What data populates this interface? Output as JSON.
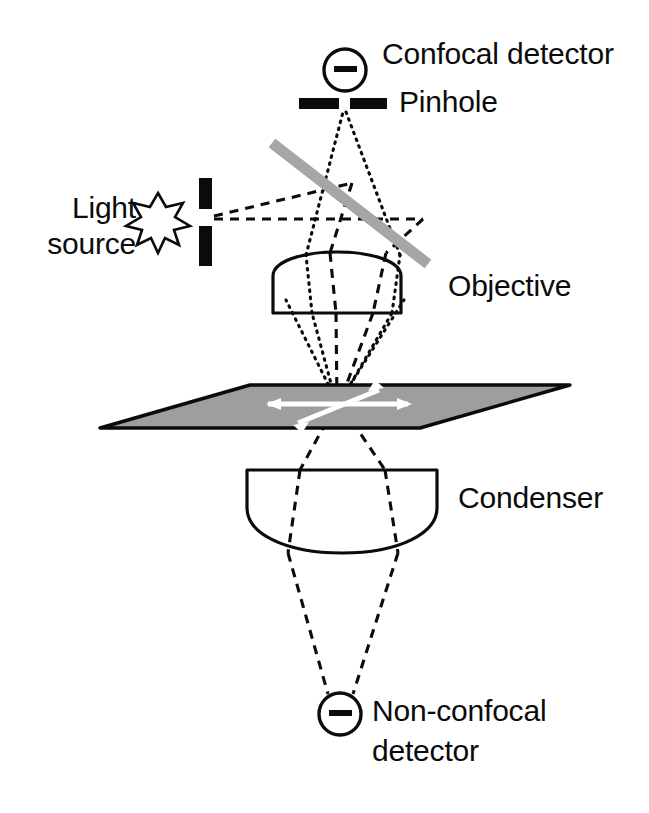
{
  "figure": {
    "background_color": "#ffffff",
    "ink_color": "#0b0b0b",
    "beamsplitter_color": "#a6a6a6",
    "specimen_fill_color": "#9e9e9e",
    "arrow_color": "#ffffff"
  },
  "labels": {
    "confocal_detector": "Confocal detector",
    "pinhole": "Pinhole",
    "light_source_line1": "Light",
    "light_source_line2": "source",
    "objective": "Objective",
    "condenser": "Condenser",
    "non_confocal_detector_line1": "Non-confocal",
    "non_confocal_detector_line2": "detector"
  },
  "components": {
    "confocal_detector": {
      "name": "confocal-detector",
      "shape": "circle-with-horizontal-bar",
      "center_x": 345,
      "center_y": 70,
      "radius": 21
    },
    "pinhole": {
      "name": "pinhole-aperture",
      "shape": "two-horizontal-bars-with-gap",
      "left_bar": {
        "x": 299,
        "y": 98,
        "width": 40,
        "height": 11
      },
      "right_bar": {
        "x": 350,
        "y": 98,
        "width": 37,
        "height": 11
      },
      "gap_center_x": 344
    },
    "light_source": {
      "name": "light-source-star",
      "shape": "eight-point-star-outline",
      "center_x": 158,
      "center_y": 218,
      "outer_radius": 25,
      "inner_radius": 11
    },
    "source_slit": {
      "name": "source-slit-aperture",
      "shape": "two-vertical-bars-with-gap",
      "top_bar": {
        "x": 199,
        "y": 178,
        "width": 13,
        "height": 31
      },
      "bottom_bar": {
        "x": 199,
        "y": 226,
        "width": 13,
        "height": 40
      },
      "gap_center_y": 217
    },
    "beamsplitter": {
      "name": "beamsplitter",
      "shape": "thick-diagonal-bar",
      "x1": 272,
      "y1": 143,
      "x2": 428,
      "y2": 264,
      "thickness": 10,
      "color": "#a6a6a6"
    },
    "objective": {
      "name": "objective-lens",
      "shape": "plano-convex-dome-up",
      "left_x": 273,
      "right_x": 401,
      "flat_bottom_y": 313,
      "dome_apex_y": 252,
      "shoulder_y": 272
    },
    "specimen_plane": {
      "name": "specimen-plane",
      "shape": "parallelogram",
      "points": "100,428 250,385 570,385 420,428",
      "fill": "#9e9e9e",
      "focus_x": 337,
      "focus_y": 404
    },
    "scan_arrows": {
      "name": "scan-axis-arrows",
      "count": 2,
      "color": "#ffffff",
      "horizontal": {
        "x1": 266,
        "y1": 404,
        "x2": 410,
        "y2": 404
      },
      "diagonal": {
        "x1": 295,
        "y1": 425,
        "x2": 382,
        "y2": 388
      }
    },
    "condenser": {
      "name": "condenser-lens",
      "shape": "plano-convex-dome-down",
      "left_x": 247,
      "right_x": 437,
      "flat_top_y": 470,
      "dome_bottom_y": 553,
      "shoulder_y": 512
    },
    "non_confocal_detector": {
      "name": "non-confocal-detector",
      "shape": "circle-with-horizontal-bar",
      "center_x": 340,
      "center_y": 714,
      "radius": 21
    }
  },
  "ray_paths": {
    "illumination_dashed": {
      "name": "illumination-ray-path",
      "style": "dashed",
      "description": "from light source slit through beamsplitter and objective to specimen focus, continuing through condenser to non-confocal detector"
    },
    "detection_dotted": {
      "name": "confocal-detection-ray-path",
      "style": "dotted",
      "description": "from specimen focus back up through objective and beamsplitter to the pinhole and confocal detector"
    }
  },
  "label_positions": {
    "confocal_detector": {
      "x": 382,
      "y": 38
    },
    "pinhole": {
      "x": 399,
      "y": 86
    },
    "light_source": {
      "x": 18,
      "y": 192,
      "align": "right",
      "width": 118
    },
    "objective": {
      "x": 448,
      "y": 268
    },
    "condenser": {
      "x": 458,
      "y": 481
    },
    "non_confocal_detector": {
      "x": 372,
      "y": 694
    }
  }
}
